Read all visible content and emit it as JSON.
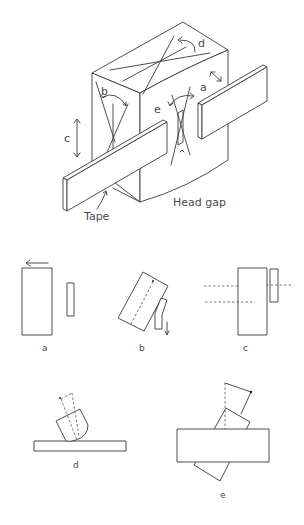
{
  "figure": {
    "main": {
      "labels": {
        "a": "a",
        "b": "b",
        "c": "c",
        "d": "d",
        "e": "e",
        "tape": "Tape",
        "head_gap": "Head gap"
      }
    },
    "panels": [
      {
        "id": "a",
        "caption": "a",
        "description": "Head-to-tape spacing (lateral translation)"
      },
      {
        "id": "b",
        "caption": "b",
        "description": "Azimuth (rotation in tape plane)"
      },
      {
        "id": "c",
        "caption": "c",
        "description": "Height (vertical translation)"
      },
      {
        "id": "d",
        "caption": "d",
        "description": "Zenith (tilt)"
      },
      {
        "id": "e",
        "caption": "e",
        "description": "Wrap (rotation about vertical axis)"
      }
    ]
  }
}
